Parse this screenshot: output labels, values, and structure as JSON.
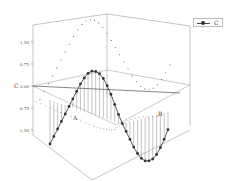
{
  "chart_data": {
    "type": "line",
    "subtype": "3d-line-with-droplines",
    "title": "",
    "xlabel": "A",
    "ylabel": "B",
    "zlabel": "C",
    "zlim": [
      -1.5,
      1.5
    ],
    "z_ticks": [
      "1.50",
      "0.75",
      "0.00",
      "-0.75",
      "-1.50"
    ],
    "grid": false,
    "legend": {
      "position": "top-right",
      "entries": [
        "C"
      ]
    },
    "series": [
      {
        "name": "C",
        "marker": "filled-circle",
        "color": "#333333",
        "droplines": true,
        "x": [
          0,
          0.2,
          0.4,
          0.6,
          0.8,
          1.0,
          1.2,
          1.4,
          1.6,
          1.8,
          2.0,
          2.2,
          2.4,
          2.6,
          2.8,
          3.0,
          3.2,
          3.4,
          3.6,
          3.8,
          4.0,
          4.2,
          4.4,
          4.6,
          4.8,
          5.0,
          5.2,
          5.4,
          5.6,
          5.8,
          6.0,
          6.2
        ],
        "values": [
          -1.5,
          -1.2,
          -0.9,
          -0.6,
          -0.3,
          0.0,
          0.3,
          0.6,
          0.9,
          1.15,
          1.35,
          1.47,
          1.5,
          1.47,
          1.35,
          1.15,
          0.9,
          0.6,
          0.3,
          0.0,
          -0.3,
          -0.6,
          -0.9,
          -1.15,
          -1.35,
          -1.47,
          -1.5,
          -1.47,
          -1.35,
          -1.15,
          -0.9,
          -0.6
        ]
      }
    ],
    "projections": [
      "back-wall dotted",
      "floor dotted"
    ]
  },
  "legend": {
    "label": "C"
  },
  "axes": {
    "z_title": "C",
    "z_ticks": [
      "1.50",
      "0.75",
      "0.00",
      "-0.75",
      "-1.50"
    ],
    "x_title": "A",
    "y_title": "B"
  }
}
